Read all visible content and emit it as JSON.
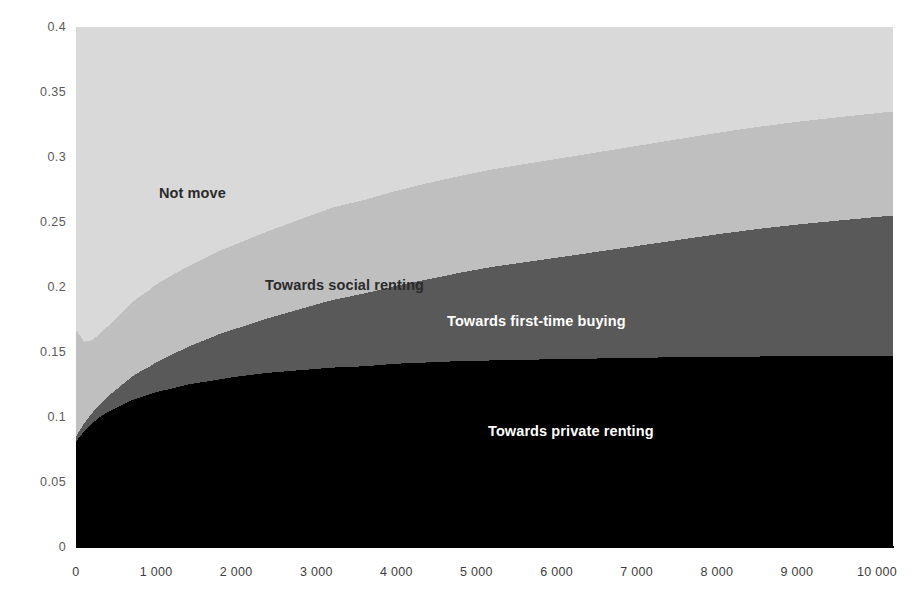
{
  "chart_data": {
    "type": "area",
    "title": "",
    "subtitle": "",
    "xlabel": "",
    "ylabel": "",
    "stacked": true,
    "grid": false,
    "legend_position": "inside-plot-labels",
    "xlim": [
      0,
      10200
    ],
    "ylim": [
      0,
      0.4
    ],
    "x_ticks": [
      0,
      1000,
      2000,
      3000,
      4000,
      5000,
      6000,
      7000,
      8000,
      9000,
      10000
    ],
    "x_tick_labels": [
      "0",
      "1 000",
      "2 000",
      "3 000",
      "4 000",
      "5 000",
      "6 000",
      "7 000",
      "8 000",
      "9 000",
      "10 000"
    ],
    "y_ticks": [
      0,
      0.05,
      0.1,
      0.15,
      0.2,
      0.25,
      0.3,
      0.35,
      0.4
    ],
    "y_tick_labels": [
      "0",
      "0.05",
      "0.1",
      "0.15",
      "0.2",
      "0.25",
      "0.3",
      "0.35",
      "0.4"
    ],
    "x": [
      0,
      100,
      200,
      300,
      400,
      500,
      600,
      700,
      800,
      900,
      1000,
      1200,
      1400,
      1600,
      1800,
      2000,
      2400,
      2800,
      3200,
      3600,
      4000,
      4400,
      4800,
      5200,
      5600,
      6000,
      6500,
      7000,
      7500,
      8000,
      8500,
      9000,
      9500,
      10200
    ],
    "series": [
      {
        "name": "Towards private renting",
        "color": "#000000",
        "label_color": "#ffffff",
        "values": [
          0.081,
          0.089,
          0.095,
          0.1,
          0.104,
          0.107,
          0.11,
          0.113,
          0.115,
          0.117,
          0.119,
          0.122,
          0.125,
          0.127,
          0.129,
          0.131,
          0.134,
          0.136,
          0.138,
          0.139,
          0.141,
          0.142,
          0.143,
          0.1435,
          0.144,
          0.1445,
          0.145,
          0.1455,
          0.146,
          0.1465,
          0.1465,
          0.147,
          0.147,
          0.147
        ]
      },
      {
        "name": "Towards first-time buying",
        "color": "#595959",
        "label_color": "#ffffff",
        "values": [
          0.004,
          0.006,
          0.008,
          0.01,
          0.012,
          0.014,
          0.016,
          0.018,
          0.02,
          0.021,
          0.023,
          0.026,
          0.029,
          0.032,
          0.035,
          0.037,
          0.042,
          0.047,
          0.052,
          0.056,
          0.06,
          0.064,
          0.068,
          0.072,
          0.075,
          0.078,
          0.082,
          0.086,
          0.09,
          0.094,
          0.098,
          0.101,
          0.104,
          0.108
        ]
      },
      {
        "name": "Towards social renting",
        "color": "#bfbfbf",
        "label_color": "#2b2b2b",
        "values": [
          0.082,
          0.063,
          0.056,
          0.054,
          0.054,
          0.055,
          0.056,
          0.057,
          0.058,
          0.059,
          0.06,
          0.061,
          0.062,
          0.063,
          0.064,
          0.065,
          0.067,
          0.069,
          0.071,
          0.072,
          0.073,
          0.074,
          0.0745,
          0.075,
          0.0755,
          0.076,
          0.0765,
          0.077,
          0.0775,
          0.078,
          0.0785,
          0.079,
          0.0795,
          0.08
        ]
      },
      {
        "name": "Not move",
        "color": "#d9d9d9",
        "label_color": "#2b2b2b",
        "values": [
          0.233,
          0.242,
          0.241,
          0.236,
          0.23,
          0.224,
          0.218,
          0.212,
          0.207,
          0.203,
          0.198,
          0.191,
          0.184,
          0.178,
          0.172,
          0.167,
          0.157,
          0.148,
          0.139,
          0.133,
          0.126,
          0.12,
          0.1145,
          0.1095,
          0.1055,
          0.1015,
          0.0965,
          0.0915,
          0.0865,
          0.0815,
          0.077,
          0.073,
          0.0695,
          0.065
        ]
      }
    ],
    "annotations": [
      {
        "text": "Not move",
        "x_px": 159,
        "y_px": 186,
        "color": "#2b2b2b"
      },
      {
        "text": "Towards social renting",
        "x_px": 265,
        "y_px": 278,
        "color": "#2b2b2b"
      },
      {
        "text": "Towards first-time buying",
        "x_px": 447,
        "y_px": 314,
        "color": "#ffffff"
      },
      {
        "text": "Towards private renting",
        "x_px": 488,
        "y_px": 424,
        "color": "#ffffff"
      }
    ]
  },
  "axis_colors": {
    "axis_line": "#000000",
    "y_tick_text": "#5a5a5a",
    "x_tick_text": "#3d3d3d"
  }
}
